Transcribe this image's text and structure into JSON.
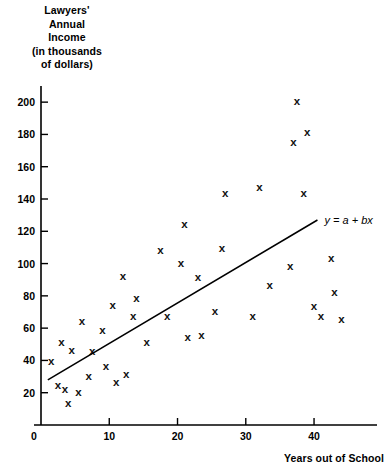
{
  "chart_data": {
    "type": "scatter",
    "title": "",
    "ylabel_lines": [
      "Lawyers'",
      "Annual",
      "Income",
      "(in thousands",
      "of dollars)"
    ],
    "xlabel": "Years out of School",
    "xlim": [
      0,
      46
    ],
    "ylim": [
      0,
      210
    ],
    "xticks": [
      0,
      10,
      20,
      30,
      40
    ],
    "xtick_labels": [
      "0",
      "10",
      "20",
      "30",
      "40"
    ],
    "yticks": [
      20,
      40,
      60,
      80,
      100,
      120,
      140,
      160,
      180,
      200
    ],
    "ytick_labels": [
      "20",
      "40",
      "60",
      "80",
      "100",
      "120",
      "140",
      "160",
      "180",
      "200"
    ],
    "grid": false,
    "legend": null,
    "marker": "x",
    "marker_color": "#111111",
    "axis_color": "#000000",
    "points": [
      {
        "x": 1.5,
        "y": 39
      },
      {
        "x": 2.5,
        "y": 24
      },
      {
        "x": 3.0,
        "y": 51
      },
      {
        "x": 3.5,
        "y": 22
      },
      {
        "x": 4.0,
        "y": 13
      },
      {
        "x": 4.5,
        "y": 46
      },
      {
        "x": 5.5,
        "y": 20
      },
      {
        "x": 6.0,
        "y": 64
      },
      {
        "x": 7.0,
        "y": 30
      },
      {
        "x": 7.5,
        "y": 45
      },
      {
        "x": 9.0,
        "y": 58
      },
      {
        "x": 9.5,
        "y": 36
      },
      {
        "x": 10.5,
        "y": 74
      },
      {
        "x": 11.0,
        "y": 26
      },
      {
        "x": 12.0,
        "y": 92
      },
      {
        "x": 12.5,
        "y": 31
      },
      {
        "x": 13.5,
        "y": 67
      },
      {
        "x": 14.0,
        "y": 78
      },
      {
        "x": 15.5,
        "y": 51
      },
      {
        "x": 17.5,
        "y": 108
      },
      {
        "x": 18.5,
        "y": 67
      },
      {
        "x": 20.5,
        "y": 100
      },
      {
        "x": 21.0,
        "y": 124
      },
      {
        "x": 21.5,
        "y": 54
      },
      {
        "x": 23.0,
        "y": 91
      },
      {
        "x": 23.5,
        "y": 55
      },
      {
        "x": 25.5,
        "y": 70
      },
      {
        "x": 26.5,
        "y": 109
      },
      {
        "x": 27.0,
        "y": 143
      },
      {
        "x": 31.0,
        "y": 67
      },
      {
        "x": 32.0,
        "y": 147
      },
      {
        "x": 33.5,
        "y": 86
      },
      {
        "x": 36.5,
        "y": 98
      },
      {
        "x": 37.0,
        "y": 175
      },
      {
        "x": 37.5,
        "y": 200
      },
      {
        "x": 38.5,
        "y": 143
      },
      {
        "x": 39.0,
        "y": 181
      },
      {
        "x": 40.0,
        "y": 73
      },
      {
        "x": 41.0,
        "y": 67
      },
      {
        "x": 42.5,
        "y": 103
      },
      {
        "x": 43.0,
        "y": 82
      },
      {
        "x": 44.0,
        "y": 65
      }
    ],
    "fit_line": {
      "label": "y = a + bx",
      "x_start": 1.0,
      "y_start": 28,
      "x_end": 40.5,
      "y_end": 127
    }
  }
}
